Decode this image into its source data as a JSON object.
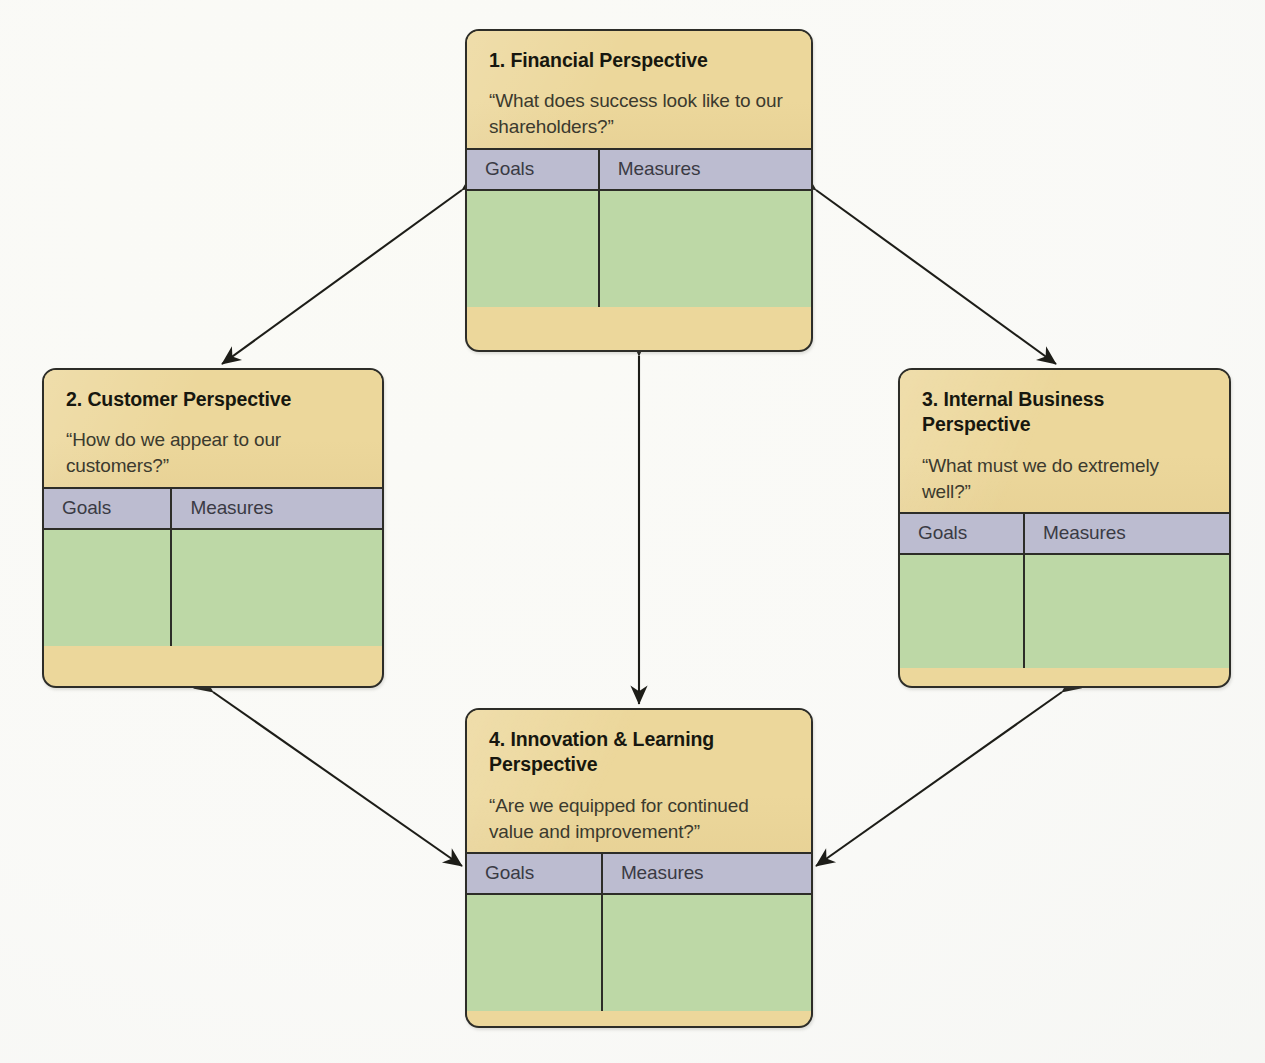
{
  "diagram": {
    "type": "balanced-scorecard",
    "colors": {
      "header_yellow": "#ecd79b",
      "column_header_lavender": "#bcbcd0",
      "body_green": "#bdd8a6",
      "outline": "#2d2d28",
      "background": "#fdfdfb",
      "title_text": "#17170f",
      "question_text": "#3b3a2e",
      "column_header_text": "#3a3a44"
    },
    "column_headers": {
      "goals": "Goals",
      "measures": "Measures"
    },
    "cards": [
      {
        "id": "financial",
        "number": "1.",
        "title": "Financial Perspective",
        "question": "“What does success look like to our shareholders?”",
        "goals_label": "Goals",
        "measures_label": "Measures",
        "goals_value": "",
        "measures_value": ""
      },
      {
        "id": "customer",
        "number": "2.",
        "title": "Customer Perspective",
        "question": "“How do we appear to our customers?”",
        "goals_label": "Goals",
        "measures_label": "Measures",
        "goals_value": "",
        "measures_value": ""
      },
      {
        "id": "internal",
        "number": "3.",
        "title": "Internal Business Perspective",
        "question": "“What must we do extremely well?”",
        "goals_label": "Goals",
        "measures_label": "Measures",
        "goals_value": "",
        "measures_value": ""
      },
      {
        "id": "innovation",
        "number": "4.",
        "title": "Innovation & Learning Perspective",
        "question": "“Are we equipped for continued value and improvement?”",
        "goals_label": "Goals",
        "measures_label": "Measures",
        "goals_value": "",
        "measures_value": ""
      }
    ],
    "connectors": [
      {
        "id": "financial-customer",
        "from": "financial",
        "to": "customer",
        "style": "double-headed-arrow",
        "orientation": "diagonal"
      },
      {
        "id": "financial-internal",
        "from": "financial",
        "to": "internal",
        "style": "double-headed-arrow",
        "orientation": "diagonal"
      },
      {
        "id": "customer-innovation",
        "from": "customer",
        "to": "innovation",
        "style": "double-headed-arrow",
        "orientation": "diagonal"
      },
      {
        "id": "internal-innovation",
        "from": "internal",
        "to": "innovation",
        "style": "double-headed-arrow",
        "orientation": "diagonal"
      },
      {
        "id": "financial-innovation",
        "from": "financial",
        "to": "innovation",
        "style": "double-headed-arrow",
        "orientation": "vertical"
      }
    ]
  },
  "card_titles": {
    "financial": "1.  Financial Perspective",
    "customer": "2.  Customer Perspective",
    "internal": "3.  Internal Business Perspective",
    "innovation": "4.  Innovation & Learning Perspective"
  }
}
